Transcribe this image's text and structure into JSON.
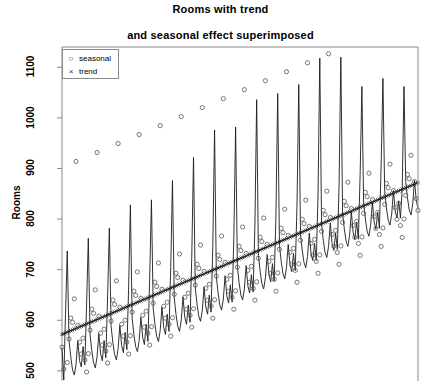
{
  "title": "Rooms with trend",
  "subtitle": "and seasonal effect superimposed",
  "legend": {
    "position": "top-left",
    "items": [
      {
        "label": "seasonal",
        "marker": "circle-open-icon",
        "glyph": "○"
      },
      {
        "label": "trend",
        "marker": "cross-x-icon",
        "glyph": "×"
      }
    ]
  },
  "axes": {
    "ylabel": "Rooms",
    "yticks": [
      500,
      600,
      700,
      800,
      900,
      1000,
      1100
    ],
    "ylim": [
      480,
      1140
    ],
    "xticks": [],
    "xlabel": "",
    "grid": false,
    "box": true
  },
  "style": {
    "line_color": "#1a1a1a",
    "marker_color": "#555555",
    "axis_color": "#8a8a8a",
    "background": "#ffffff"
  },
  "chart_data": {
    "type": "line",
    "title": "Rooms with trend",
    "subtitle": "and seasonal effect superimposed",
    "xlabel": "",
    "ylabel": "Rooms",
    "ylim": [
      480,
      1140
    ],
    "yticks": [
      500,
      600,
      700,
      800,
      900,
      1000,
      1100
    ],
    "grid": false,
    "legend_position": "top-left",
    "n_cycles": 17,
    "points_per_cycle": 12,
    "trend": {
      "name": "trend",
      "marker": "x",
      "description": "linear rising trend fitted through the series",
      "start_value": 572,
      "end_value": 872,
      "slope_per_point": 1.47
    },
    "seasonal_index": [
      -25,
      -70,
      -95,
      -60,
      -15,
      25,
      15,
      60,
      330,
      5,
      -30,
      -55
    ],
    "series": [
      {
        "name": "observed",
        "type": "line",
        "description": "monthly observed Rooms series with strong annual spike",
        "values": [
          545,
          482,
          612,
          737,
          560,
          528,
          502,
          492,
          512,
          560,
          520,
          508,
          548,
          512,
          628,
          762,
          572,
          540,
          516,
          506,
          528,
          574,
          534,
          520,
          560,
          526,
          646,
          782,
          588,
          556,
          532,
          522,
          544,
          590,
          550,
          536,
          576,
          542,
          664,
          828,
          604,
          572,
          548,
          538,
          560,
          606,
          566,
          552,
          592,
          558,
          684,
          838,
          624,
          592,
          568,
          558,
          580,
          626,
          586,
          572,
          612,
          578,
          704,
          876,
          644,
          612,
          588,
          578,
          600,
          646,
          606,
          592,
          630,
          596,
          726,
          922,
          664,
          632,
          608,
          598,
          620,
          666,
          626,
          612,
          650,
          616,
          746,
          976,
          686,
          654,
          630,
          620,
          642,
          688,
          648,
          634,
          670,
          636,
          766,
          982,
          706,
          674,
          650,
          640,
          662,
          708,
          668,
          654,
          690,
          656,
          788,
          1036,
          728,
          696,
          672,
          662,
          684,
          730,
          690,
          676,
          712,
          678,
          808,
          1048,
          748,
          716,
          692,
          682,
          704,
          750,
          710,
          696,
          732,
          698,
          828,
          1066,
          770,
          738,
          714,
          704,
          726,
          772,
          732,
          718,
          752,
          718,
          848,
          1118,
          790,
          758,
          734,
          724,
          746,
          792,
          752,
          738,
          772,
          740,
          868,
          1120,
          812,
          780,
          756,
          746,
          768,
          814,
          774,
          760,
          794,
          760,
          888,
          1062,
          832,
          800,
          776,
          766,
          788,
          834,
          794,
          780,
          814,
          782,
          908,
          1078,
          854,
          822,
          798,
          788,
          810,
          856,
          816,
          802,
          836,
          802,
          860,
          1062,
          874,
          842,
          818,
          808,
          830,
          876,
          836,
          822
        ]
      }
    ]
  }
}
